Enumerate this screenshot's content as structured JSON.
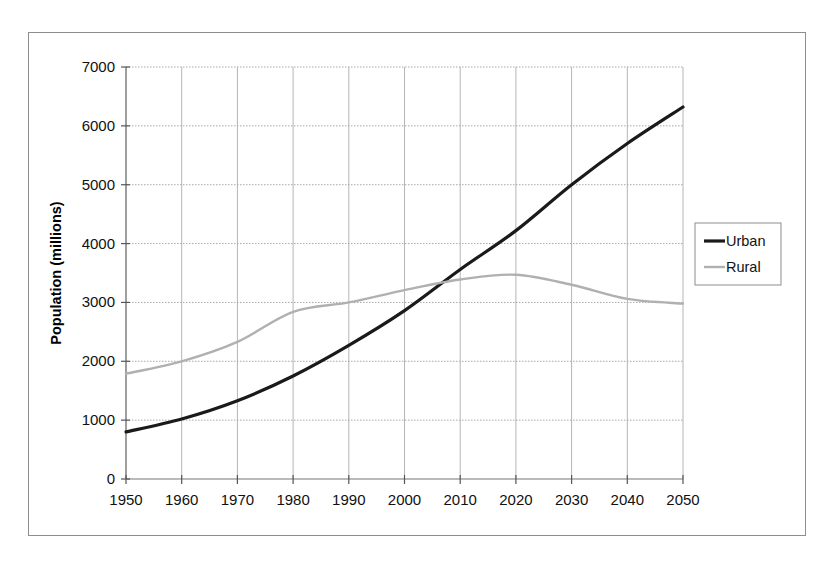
{
  "figure": {
    "border_color": "#8d8d8d",
    "background": "#ffffff"
  },
  "chart_data": {
    "type": "line",
    "title": "",
    "xlabel": "",
    "ylabel": "Population (millions)",
    "xlim": [
      1950,
      2050
    ],
    "ylim": [
      0,
      7000
    ],
    "xticks": [
      "1950",
      "1960",
      "1970",
      "1980",
      "1990",
      "2000",
      "2010",
      "2020",
      "2030",
      "2040",
      "2050"
    ],
    "yticks": [
      "0",
      "1000",
      "2000",
      "3000",
      "4000",
      "5000",
      "6000",
      "7000"
    ],
    "x": [
      1950,
      1960,
      1970,
      1980,
      1990,
      2000,
      2010,
      2020,
      2030,
      2040,
      2050
    ],
    "grid": true,
    "grid_color_horizontal": "#a8a8a8",
    "grid_color_vertical": "#b5b5b5",
    "legend_position": "right",
    "series": [
      {
        "name": "Urban",
        "color": "#1a1a1a",
        "width": 3.2,
        "values": [
          800,
          1020,
          1330,
          1750,
          2270,
          2860,
          3560,
          4220,
          5000,
          5700,
          6320
        ]
      },
      {
        "name": "Rural",
        "color": "#b0b0b0",
        "width": 2.4,
        "values": [
          1790,
          2000,
          2330,
          2840,
          3000,
          3210,
          3390,
          3470,
          3300,
          3060,
          2980
        ]
      }
    ]
  },
  "legend": {
    "items": [
      {
        "label": "Urban",
        "color": "#1a1a1a",
        "width": 3.2
      },
      {
        "label": "Rural",
        "color": "#b0b0b0",
        "width": 2.4
      }
    ]
  }
}
